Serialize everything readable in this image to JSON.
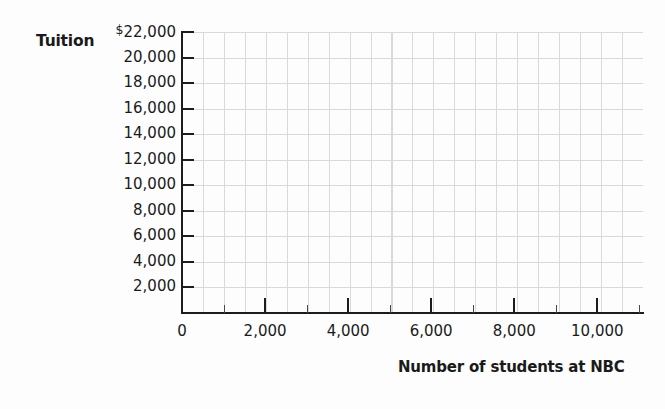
{
  "chart_data": {
    "type": "scatter",
    "title": "",
    "subtitle": "",
    "xlabel": "Number of students at NBC",
    "ylabel": "Tuition",
    "grid": true,
    "legend": null,
    "series": [],
    "x": [],
    "values": [],
    "note": "Empty grid / blank plotting template - no data points are plotted",
    "xlim": [
      0,
      11100
    ],
    "ylim": [
      0,
      22000
    ],
    "x_ticks": [
      {
        "value": 0,
        "label": "0"
      },
      {
        "value": 2000,
        "label": "2,000"
      },
      {
        "value": 4000,
        "label": "4,000"
      },
      {
        "value": 6000,
        "label": "6,000"
      },
      {
        "value": 8000,
        "label": "8,000"
      },
      {
        "value": 10000,
        "label": "10,000"
      }
    ],
    "y_ticks": [
      {
        "value": 22000,
        "prefix": "$",
        "label": "22,000"
      },
      {
        "value": 20000,
        "prefix": "",
        "label": "20,000"
      },
      {
        "value": 18000,
        "prefix": "",
        "label": "18,000"
      },
      {
        "value": 16000,
        "prefix": "",
        "label": "16,000"
      },
      {
        "value": 14000,
        "prefix": "",
        "label": "14,000"
      },
      {
        "value": 12000,
        "prefix": "",
        "label": "12,000"
      },
      {
        "value": 10000,
        "prefix": "",
        "label": "10,000"
      },
      {
        "value": 8000,
        "prefix": "",
        "label": "8,000"
      },
      {
        "value": 6000,
        "prefix": "",
        "label": "6,000"
      },
      {
        "value": 4000,
        "prefix": "",
        "label": "4,000"
      },
      {
        "value": 2000,
        "prefix": "",
        "label": "2,000"
      }
    ],
    "colors": {
      "background": "#fdfdfd",
      "axis": "#1c1c1c",
      "gridline": "#d9d9d9",
      "text": "#1a1a1a"
    }
  }
}
